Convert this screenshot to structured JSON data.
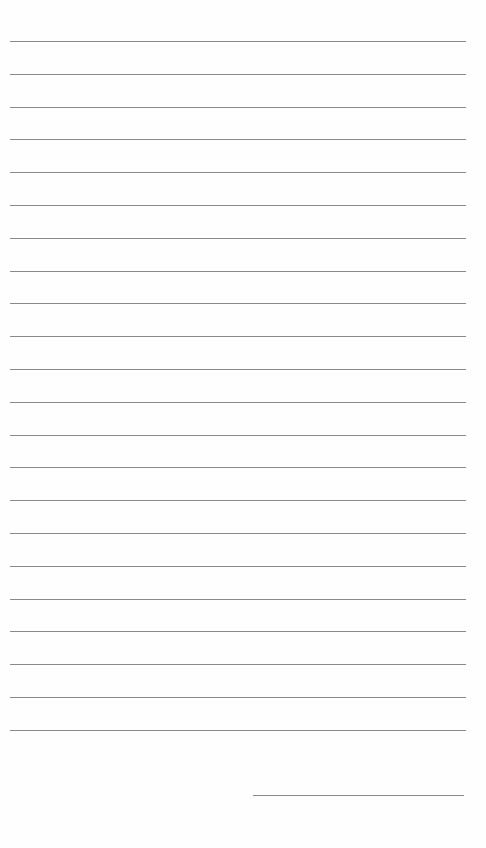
{
  "page": {
    "type": "lined-paper",
    "background": "#fefefe",
    "line_color": "#8a8a8a",
    "line_count": 22,
    "first_line_y": 41,
    "line_spacing": 32.8,
    "signature_line": {
      "x": 253,
      "y": 795,
      "width": 211
    }
  }
}
